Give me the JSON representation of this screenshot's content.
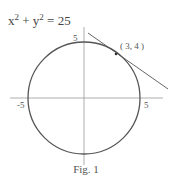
{
  "equation": {
    "x_term": "x",
    "y_term": "y",
    "exp": "2",
    "rhs": "25",
    "plus": "+",
    "equals": "="
  },
  "labels": {
    "top": "5",
    "left": "-5",
    "right": "5",
    "point": "( 3, 4 )"
  },
  "caption": "Fig. 1",
  "colors": {
    "stroke": "#555555",
    "axis": "#888888"
  }
}
